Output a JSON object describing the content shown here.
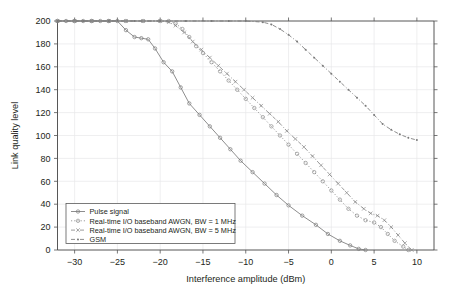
{
  "chart_data": {
    "type": "line",
    "title": "",
    "xlabel": "Interference amplitude (dBm)",
    "ylabel": "Link quality level",
    "xlim": [
      -32,
      12
    ],
    "ylim": [
      0,
      200
    ],
    "xticks": [
      -30,
      -25,
      -20,
      -15,
      -10,
      -5,
      0,
      5,
      10
    ],
    "yticks": [
      0,
      20,
      40,
      60,
      80,
      100,
      120,
      140,
      160,
      180,
      200
    ],
    "xticklabels": [
      "−30",
      "−25",
      "−20",
      "−15",
      "−10",
      "−5",
      "0",
      "5",
      "10"
    ],
    "yticklabels": [
      "0",
      "20",
      "40",
      "60",
      "80",
      "100",
      "120",
      "140",
      "160",
      "180",
      "200"
    ],
    "grid": true,
    "legend_position": "lower left",
    "series": [
      {
        "name": "Pulse signal",
        "color": "#7a7a7a",
        "dash": "none",
        "marker": "circle",
        "points": [
          [
            -32,
            200
          ],
          [
            -31,
            200
          ],
          [
            -30,
            200
          ],
          [
            -29,
            200
          ],
          [
            -28,
            200
          ],
          [
            -27,
            200
          ],
          [
            -26,
            200
          ],
          [
            -25,
            200
          ],
          [
            -24,
            192
          ],
          [
            -23,
            186
          ],
          [
            -22.2,
            185
          ],
          [
            -21.4,
            184
          ],
          [
            -20.6,
            176
          ],
          [
            -19.6,
            164
          ],
          [
            -18.6,
            156
          ],
          [
            -17.6,
            142
          ],
          [
            -16.6,
            128
          ],
          [
            -15.4,
            118
          ],
          [
            -14.2,
            108
          ],
          [
            -13,
            98
          ],
          [
            -11.8,
            88
          ],
          [
            -10.6,
            78
          ],
          [
            -9.2,
            68
          ],
          [
            -7.8,
            58
          ],
          [
            -6.4,
            48
          ],
          [
            -5,
            39
          ],
          [
            -3.4,
            30
          ],
          [
            -1.8,
            22
          ],
          [
            -0.4,
            14
          ],
          [
            1,
            8
          ],
          [
            2.2,
            4
          ],
          [
            3.2,
            1
          ],
          [
            4,
            0
          ]
        ]
      },
      {
        "name": "Real-time I/O baseband AWGN, BW = 1 MHz",
        "color": "#8a8a8a",
        "dash": "dotted",
        "marker": "circle",
        "points": [
          [
            -32,
            200
          ],
          [
            -30,
            200
          ],
          [
            -28,
            200
          ],
          [
            -26,
            200
          ],
          [
            -24,
            200
          ],
          [
            -22,
            200
          ],
          [
            -20,
            200
          ],
          [
            -19,
            200
          ],
          [
            -18.2,
            198
          ],
          [
            -17.4,
            193
          ],
          [
            -16.6,
            186
          ],
          [
            -15.8,
            178
          ],
          [
            -15,
            172
          ],
          [
            -14,
            164
          ],
          [
            -13,
            156
          ],
          [
            -12,
            148
          ],
          [
            -11,
            140
          ],
          [
            -10,
            132
          ],
          [
            -9,
            124
          ],
          [
            -8,
            116
          ],
          [
            -7,
            108
          ],
          [
            -6,
            100
          ],
          [
            -5,
            92
          ],
          [
            -4,
            84
          ],
          [
            -3,
            76
          ],
          [
            -2,
            68
          ],
          [
            -1,
            60
          ],
          [
            0,
            52
          ],
          [
            1,
            44
          ],
          [
            2,
            36
          ],
          [
            3,
            30
          ],
          [
            4,
            26
          ],
          [
            5,
            24
          ],
          [
            5.8,
            20
          ],
          [
            6.6,
            14
          ],
          [
            7.4,
            8
          ],
          [
            8.4,
            3
          ],
          [
            9,
            0
          ]
        ]
      },
      {
        "name": "Real-time I/O baseband AWGN, BW = 5 MHz",
        "color": "#8a8a8a",
        "dash": "dashdot",
        "marker": "cross",
        "points": [
          [
            -32,
            200
          ],
          [
            -30,
            200
          ],
          [
            -28,
            200
          ],
          [
            -26,
            200
          ],
          [
            -24,
            200
          ],
          [
            -22,
            200
          ],
          [
            -20,
            200
          ],
          [
            -19,
            199
          ],
          [
            -18.2,
            196
          ],
          [
            -17.2,
            190
          ],
          [
            -16.2,
            182
          ],
          [
            -15.2,
            175
          ],
          [
            -14.2,
            168
          ],
          [
            -13.2,
            161
          ],
          [
            -12.2,
            154
          ],
          [
            -11.2,
            147
          ],
          [
            -10.2,
            140
          ],
          [
            -9.2,
            133
          ],
          [
            -8.2,
            126
          ],
          [
            -7.2,
            119
          ],
          [
            -6.2,
            112
          ],
          [
            -5.2,
            104
          ],
          [
            -4.2,
            97
          ],
          [
            -3.2,
            90
          ],
          [
            -2.2,
            82
          ],
          [
            -1.2,
            74
          ],
          [
            -0.2,
            66
          ],
          [
            0.8,
            58
          ],
          [
            1.8,
            50
          ],
          [
            2.8,
            42
          ],
          [
            3.8,
            36
          ],
          [
            4.6,
            32
          ],
          [
            5.4,
            30
          ],
          [
            6.2,
            26
          ],
          [
            7,
            20
          ],
          [
            7.8,
            13
          ],
          [
            8.6,
            6
          ],
          [
            9.4,
            0
          ]
        ]
      },
      {
        "name": "GSM",
        "color": "#7a7a7a",
        "dash": "dashdot",
        "marker": "dot",
        "points": [
          [
            -32,
            200
          ],
          [
            -29,
            200
          ],
          [
            -26,
            200
          ],
          [
            -23,
            200
          ],
          [
            -20,
            200
          ],
          [
            -17,
            200
          ],
          [
            -14,
            200
          ],
          [
            -12,
            200
          ],
          [
            -10,
            200
          ],
          [
            -8,
            199
          ],
          [
            -7,
            197
          ],
          [
            -6,
            193
          ],
          [
            -5,
            188
          ],
          [
            -4,
            182
          ],
          [
            -3,
            175
          ],
          [
            -2,
            168
          ],
          [
            -1,
            161
          ],
          [
            0,
            154
          ],
          [
            1,
            147
          ],
          [
            2,
            140
          ],
          [
            3,
            133
          ],
          [
            4,
            126
          ],
          [
            5,
            118
          ],
          [
            6,
            110
          ],
          [
            7,
            105
          ],
          [
            8,
            101
          ],
          [
            9,
            98
          ],
          [
            10,
            96
          ]
        ]
      }
    ]
  },
  "legend": {
    "items": [
      {
        "label": "Pulse signal"
      },
      {
        "label": "Real-time I/O baseband AWGN, BW = 1 MHz"
      },
      {
        "label": "Real-time I/O baseband AWGN, BW = 5 MHz"
      },
      {
        "label": "GSM"
      }
    ]
  }
}
